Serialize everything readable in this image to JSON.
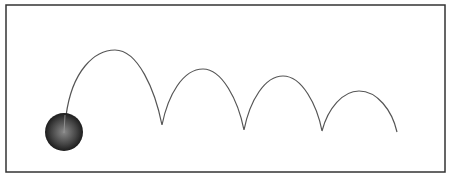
{
  "diagram": {
    "frame_color": "#333333",
    "path_color": "#555555",
    "ball": {
      "cx": 64,
      "cy": 132,
      "r": 19,
      "color_center": "#8a8a8a",
      "color_edge": "#111111"
    },
    "bounces": [
      {
        "start": [
          66,
          116
        ],
        "peak": [
          115,
          50
        ],
        "end": [
          162,
          125
        ]
      },
      {
        "start": [
          162,
          125
        ],
        "peak": [
          203,
          69
        ],
        "end": [
          244,
          130
        ]
      },
      {
        "start": [
          244,
          130
        ],
        "peak": [
          283,
          76
        ],
        "end": [
          322,
          131
        ]
      },
      {
        "start": [
          322,
          131
        ],
        "peak": [
          359,
          91
        ],
        "end": [
          397,
          132
        ]
      }
    ]
  }
}
